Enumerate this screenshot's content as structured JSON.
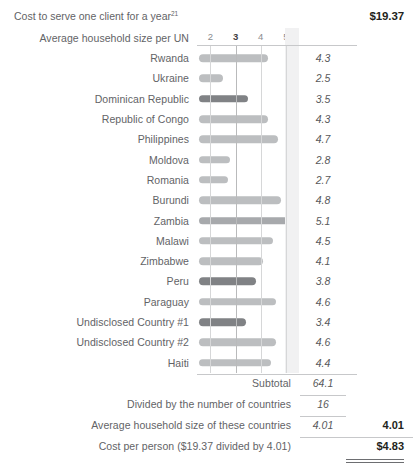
{
  "header": {
    "title": "Cost to serve one client for a year",
    "footnote_marker": "21",
    "amount": "$19.37"
  },
  "axis": {
    "label": "Average household size per UN",
    "ticks": [
      {
        "value": 2,
        "label": "2",
        "emphasis": false
      },
      {
        "value": 3,
        "label": "3",
        "emphasis": true
      },
      {
        "value": 4,
        "label": "4",
        "emphasis": false
      },
      {
        "value": 5,
        "label": "5",
        "emphasis": false
      }
    ]
  },
  "chart_data": {
    "type": "bar",
    "orientation": "horizontal",
    "title": "Average household size per UN",
    "xlabel": "Average household size per UN",
    "ylabel": "",
    "xlim": [
      1.55,
      5.4
    ],
    "grid": true,
    "legend": false,
    "categories": [
      "Rwanda",
      "Ukraine",
      "Dominican Republic",
      "Republic of Congo",
      "Philippines",
      "Moldova",
      "Romania",
      "Burundi",
      "Zambia",
      "Malawi",
      "Zimbabwe",
      "Peru",
      "Paraguay",
      "Undisclosed Country #1",
      "Undisclosed Country #2",
      "Haiti"
    ],
    "values": [
      4.3,
      2.5,
      3.5,
      4.3,
      4.7,
      2.8,
      2.7,
      4.8,
      5.1,
      4.5,
      4.1,
      3.8,
      4.6,
      3.4,
      4.6,
      4.4
    ],
    "value_labels": [
      "4.3",
      "2.5",
      "3.5",
      "4.3",
      "4.7",
      "2.8",
      "2.7",
      "4.8",
      "5.1",
      "4.5",
      "4.1",
      "3.8",
      "4.6",
      "3.4",
      "4.6",
      "4.4"
    ],
    "bar_colors": [
      "#bcbec0",
      "#bcbec0",
      "#808285",
      "#bcbec0",
      "#bcbec0",
      "#bcbec0",
      "#bcbec0",
      "#bcbec0",
      "#a7a9ac",
      "#bcbec0",
      "#bcbec0",
      "#808285",
      "#bcbec0",
      "#808285",
      "#bcbec0",
      "#bcbec0"
    ]
  },
  "summary": [
    {
      "label": "Subtotal",
      "value": "64.1",
      "extra": ""
    },
    {
      "label": "Divided by the number of countries",
      "value": "16",
      "extra": ""
    },
    {
      "label": "Average household size of these countries",
      "value": "4.01",
      "extra": "4.01"
    },
    {
      "label": "Cost per person ($19.37 divided by 4.01)",
      "value": "",
      "extra": "$4.83"
    }
  ],
  "colors": {
    "bar_light": "#bcbec0",
    "bar_mid": "#a7a9ac",
    "bar_dark": "#808285",
    "band": "#f1f1f2",
    "text": "#626366",
    "bold_text": "#231f20"
  }
}
